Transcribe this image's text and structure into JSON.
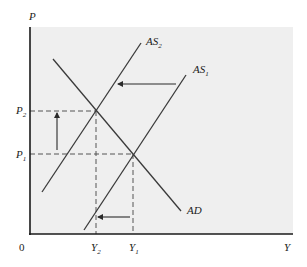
{
  "diagram": {
    "type": "AD-AS economic diagram",
    "colors": {
      "background": "#ffffff",
      "plot_area": "#efefef",
      "lines": "#3a3a3a",
      "dashes": "#555555"
    },
    "axes": {
      "y_label": "P",
      "x_label": "Y",
      "origin_label": "0"
    },
    "curves": [
      {
        "id": "AD",
        "label": "AD",
        "x1": 53,
        "y1": 59,
        "x2": 181,
        "y2": 211
      },
      {
        "id": "AS2",
        "label": "AS",
        "sub": "2",
        "x1": 42,
        "y1": 192,
        "x2": 141,
        "y2": 43
      },
      {
        "id": "AS1",
        "label": "AS",
        "sub": "1",
        "x1": 84,
        "y1": 230,
        "x2": 186,
        "y2": 75
      }
    ],
    "equilibria": [
      {
        "id": "E2",
        "price_label": "P",
        "price_sub": "2",
        "output_label": "Y",
        "output_sub": "2",
        "x": 96,
        "y": 111
      },
      {
        "id": "E1",
        "price_label": "P",
        "price_sub": "1",
        "output_label": "Y",
        "output_sub": "1",
        "x": 133,
        "y": 154
      }
    ],
    "arrows": [
      {
        "id": "supply-shift-arrow",
        "meaning": "AS shifts left",
        "x1": 176,
        "y1": 84,
        "x2": 118,
        "y2": 84
      },
      {
        "id": "price-rise-arrow",
        "meaning": "price level rises",
        "x1": 57,
        "y1": 150,
        "x2": 57,
        "y2": 113
      },
      {
        "id": "output-fall-arrow",
        "meaning": "output falls",
        "x1": 130,
        "y1": 217,
        "x2": 98,
        "y2": 217
      }
    ]
  }
}
